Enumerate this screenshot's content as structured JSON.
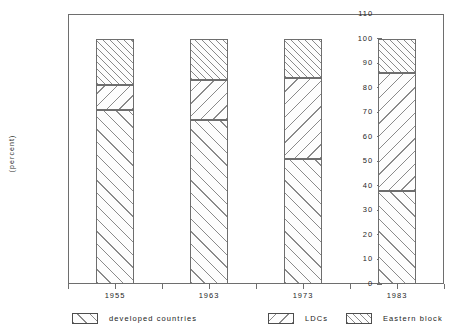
{
  "chart_data": {
    "type": "bar",
    "subtype": "stacked-100-percent",
    "title": "",
    "xlabel": "",
    "ylabel": "(percent)",
    "ylim": [
      0,
      110
    ],
    "ytick_step": 10,
    "yticks": [
      "110",
      "100",
      "90",
      "80",
      "70",
      "60",
      "50",
      "40",
      "30",
      "20",
      "10",
      "0"
    ],
    "grid": false,
    "legend_position": "bottom",
    "categories": [
      "1955",
      "1963",
      "1973",
      "1983"
    ],
    "series": [
      {
        "name": "developed countries",
        "pattern": "diagonal-hatch-wide",
        "values": [
          71,
          67,
          51,
          38
        ]
      },
      {
        "name": "LDCs",
        "pattern": "back-diagonal-hatch",
        "values": [
          10,
          16,
          33,
          48
        ]
      },
      {
        "name": "Eastern block",
        "pattern": "diagonal-hatch-dense",
        "values": [
          19,
          17,
          16,
          14
        ]
      }
    ],
    "cumulative_tops": [
      {
        "category": "1955",
        "developed": 71,
        "plus_ldcs": 81,
        "total": 100
      },
      {
        "category": "1963",
        "developed": 67,
        "plus_ldcs": 83,
        "total": 100
      },
      {
        "category": "1973",
        "developed": 51,
        "plus_ldcs": 84,
        "total": 100
      },
      {
        "category": "1983",
        "developed": 38,
        "plus_ldcs": 86,
        "total": 100
      }
    ]
  },
  "axis": {
    "y_title": "(percent)",
    "y_ticks": [
      "110",
      "100",
      "90",
      "80",
      "70",
      "60",
      "50",
      "40",
      "30",
      "20",
      "10",
      "0"
    ],
    "x_labels": [
      "1955",
      "1963",
      "1973",
      "1983"
    ]
  },
  "legend": {
    "items": [
      {
        "label": "developed countries"
      },
      {
        "label": "LDCs"
      },
      {
        "label": "Eastern block"
      }
    ]
  },
  "colors": {
    "axis": "#6e6e6e",
    "hatch": "#8a8a8a",
    "text": "#1f1f1f",
    "background": "#ffffff"
  }
}
